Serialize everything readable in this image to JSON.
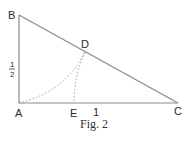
{
  "figure": {
    "caption": "Fig. 2",
    "points": {
      "A": {
        "label": "A"
      },
      "B": {
        "label": "B"
      },
      "C": {
        "label": "C"
      },
      "D": {
        "label": "D"
      },
      "E": {
        "label": "E"
      }
    },
    "segment_labels": {
      "AB": {
        "num": "1",
        "den": "2"
      },
      "AC": "1"
    },
    "colors": {
      "line": "#8a8a8a",
      "dotted": "#9a9a9a",
      "text": "#2a2a2a"
    }
  }
}
